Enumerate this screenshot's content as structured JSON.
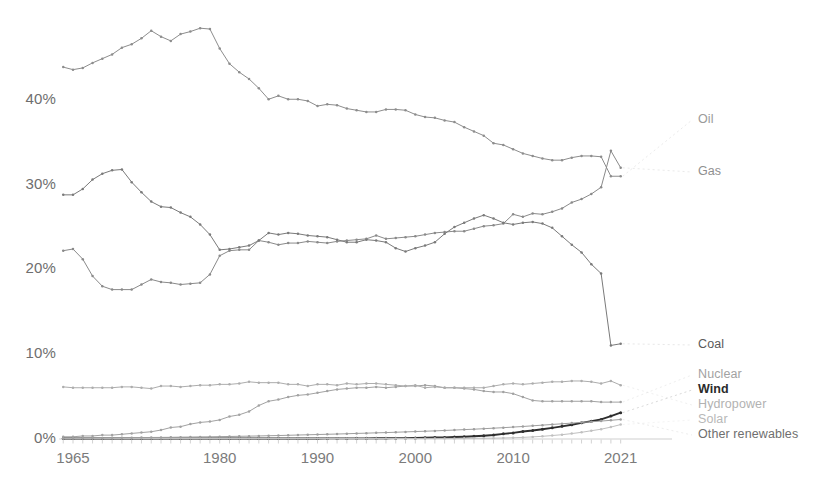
{
  "chart_data": {
    "type": "line",
    "title": "",
    "subtitle": "",
    "xlabel": "",
    "ylabel": "",
    "grid": false,
    "legend_position": "right-inline",
    "xlim": [
      1964,
      2022
    ],
    "ylim": [
      0,
      45
    ],
    "ytick_labels": [
      "40%",
      "30%",
      "20%",
      "10%",
      "0%"
    ],
    "ytick_values": [
      40,
      30,
      20,
      10,
      0
    ],
    "xtick_labels": [
      "1965",
      "1980",
      "1990",
      "2000",
      "2010",
      "2021"
    ],
    "xtick_values": [
      1965,
      1980,
      1990,
      2000,
      2010,
      2021
    ],
    "x": [
      1964,
      1965,
      1966,
      1967,
      1968,
      1969,
      1970,
      1971,
      1972,
      1973,
      1974,
      1975,
      1976,
      1977,
      1978,
      1979,
      1980,
      1981,
      1982,
      1983,
      1984,
      1985,
      1986,
      1987,
      1988,
      1989,
      1990,
      1991,
      1992,
      1993,
      1994,
      1995,
      1996,
      1997,
      1998,
      1999,
      2000,
      2001,
      2002,
      2003,
      2004,
      2005,
      2006,
      2007,
      2008,
      2009,
      2010,
      2011,
      2012,
      2013,
      2014,
      2015,
      2016,
      2017,
      2018,
      2019,
      2020,
      2021
    ],
    "series": [
      {
        "name": "Oil",
        "color": "#8d8d8d",
        "label_color": "#9a9a9a",
        "bold": false,
        "values": [
          43.9,
          43.6,
          43.8,
          44.4,
          44.9,
          45.4,
          46.2,
          46.6,
          47.3,
          48.2,
          47.5,
          47.0,
          47.8,
          48.1,
          48.5,
          48.4,
          46.1,
          44.3,
          43.3,
          42.5,
          41.4,
          40.1,
          40.5,
          40.1,
          40.1,
          39.9,
          39.3,
          39.5,
          39.4,
          39.0,
          38.8,
          38.6,
          38.6,
          38.9,
          38.9,
          38.8,
          38.3,
          38.0,
          37.9,
          37.6,
          37.4,
          36.8,
          36.3,
          35.8,
          34.9,
          34.7,
          34.2,
          33.7,
          33.4,
          33.1,
          32.9,
          32.9,
          33.2,
          33.4,
          33.4,
          33.3,
          31.0,
          31.0
        ]
      },
      {
        "name": "Gas",
        "color": "#8a8a8a",
        "label_color": "#8f8f8f",
        "bold": false,
        "values": [
          22.2,
          22.4,
          21.2,
          19.2,
          18.0,
          17.6,
          17.6,
          17.6,
          18.2,
          18.8,
          18.5,
          18.4,
          18.2,
          18.3,
          18.4,
          19.4,
          21.6,
          22.2,
          22.3,
          22.3,
          23.4,
          23.2,
          22.9,
          23.1,
          23.1,
          23.3,
          23.2,
          23.1,
          23.3,
          23.4,
          23.5,
          23.6,
          24.0,
          23.6,
          23.7,
          23.8,
          23.9,
          24.1,
          24.3,
          24.4,
          24.5,
          24.5,
          24.8,
          25.1,
          25.2,
          25.4,
          26.5,
          26.2,
          26.6,
          26.5,
          26.8,
          27.2,
          27.9,
          28.3,
          28.9,
          29.7,
          34.0,
          32.0
        ]
      },
      {
        "name": "Coal",
        "color": "#7a7a7a",
        "label_color": "#5a5a5a",
        "bold": false,
        "values": [
          28.8,
          28.8,
          29.5,
          30.6,
          31.3,
          31.7,
          31.8,
          30.3,
          29.1,
          28.0,
          27.4,
          27.3,
          26.7,
          26.2,
          25.3,
          24.1,
          22.3,
          22.4,
          22.6,
          22.8,
          23.4,
          24.3,
          24.1,
          24.3,
          24.2,
          24.0,
          23.9,
          23.8,
          23.5,
          23.2,
          23.2,
          23.5,
          23.4,
          23.2,
          22.5,
          22.1,
          22.5,
          22.8,
          23.2,
          24.2,
          25.0,
          25.5,
          26.0,
          26.4,
          26.0,
          25.5,
          25.3,
          25.5,
          25.6,
          25.4,
          24.9,
          23.9,
          22.9,
          22.0,
          20.6,
          19.5,
          11.0,
          11.2
        ]
      },
      {
        "name": "Nuclear",
        "color": "#a2a2a2",
        "label_color": "#a2a2a2",
        "bold": false,
        "values": [
          0.2,
          0.2,
          0.3,
          0.3,
          0.4,
          0.4,
          0.5,
          0.6,
          0.7,
          0.8,
          1.0,
          1.3,
          1.4,
          1.7,
          1.9,
          2.0,
          2.2,
          2.6,
          2.8,
          3.2,
          3.9,
          4.4,
          4.6,
          4.9,
          5.1,
          5.2,
          5.4,
          5.6,
          5.8,
          5.9,
          6.0,
          6.0,
          6.1,
          6.0,
          6.1,
          6.2,
          6.2,
          6.3,
          6.2,
          6.0,
          6.0,
          5.9,
          5.8,
          5.6,
          5.5,
          5.5,
          5.3,
          4.9,
          4.5,
          4.4,
          4.4,
          4.4,
          4.4,
          4.4,
          4.4,
          4.3,
          4.3,
          4.3
        ]
      },
      {
        "name": "Hydropower",
        "color": "#adadad",
        "label_color": "#b2b2b2",
        "bold": false,
        "values": [
          6.1,
          6.0,
          6.0,
          6.0,
          6.0,
          6.0,
          6.1,
          6.1,
          6.0,
          5.9,
          6.2,
          6.2,
          6.1,
          6.2,
          6.3,
          6.3,
          6.4,
          6.4,
          6.5,
          6.7,
          6.6,
          6.6,
          6.6,
          6.4,
          6.4,
          6.2,
          6.4,
          6.4,
          6.3,
          6.5,
          6.4,
          6.5,
          6.5,
          6.4,
          6.3,
          6.2,
          6.3,
          6.0,
          6.1,
          6.0,
          6.0,
          6.0,
          6.0,
          6.0,
          6.2,
          6.4,
          6.5,
          6.4,
          6.5,
          6.6,
          6.7,
          6.7,
          6.8,
          6.8,
          6.7,
          6.5,
          6.8,
          6.3
        ]
      },
      {
        "name": "Wind",
        "color": "#2e2e2e",
        "label_color": "#2b2b2b",
        "bold": true,
        "values": [
          0.0,
          0.0,
          0.0,
          0.0,
          0.0,
          0.0,
          0.0,
          0.0,
          0.0,
          0.0,
          0.0,
          0.0,
          0.0,
          0.0,
          0.0,
          0.0,
          0.0,
          0.0,
          0.0,
          0.0,
          0.0,
          0.0,
          0.0,
          0.0,
          0.0,
          0.0,
          0.0,
          0.01,
          0.01,
          0.01,
          0.02,
          0.02,
          0.03,
          0.03,
          0.04,
          0.05,
          0.07,
          0.09,
          0.11,
          0.13,
          0.17,
          0.21,
          0.26,
          0.33,
          0.42,
          0.55,
          0.66,
          0.83,
          0.95,
          1.1,
          1.26,
          1.44,
          1.62,
          1.85,
          2.05,
          2.25,
          2.65,
          3.05
        ]
      },
      {
        "name": "Solar",
        "color": "#c0c0c0",
        "label_color": "#b8b8b8",
        "bold": false,
        "values": [
          0.0,
          0.0,
          0.0,
          0.0,
          0.0,
          0.0,
          0.0,
          0.0,
          0.0,
          0.0,
          0.0,
          0.0,
          0.0,
          0.0,
          0.0,
          0.0,
          0.0,
          0.0,
          0.0,
          0.0,
          0.0,
          0.0,
          0.0,
          0.0,
          0.0,
          0.0,
          0.0,
          0.0,
          0.0,
          0.0,
          0.0,
          0.0,
          0.0,
          0.0,
          0.0,
          0.0,
          0.0,
          0.01,
          0.01,
          0.01,
          0.01,
          0.02,
          0.02,
          0.03,
          0.04,
          0.06,
          0.09,
          0.13,
          0.19,
          0.26,
          0.35,
          0.45,
          0.58,
          0.73,
          0.92,
          1.1,
          1.35,
          1.65
        ]
      },
      {
        "name": "Other renewables",
        "color": "#9e9e9e",
        "label_color": "#6f6f6f",
        "bold": false,
        "values": [
          0.05,
          0.06,
          0.06,
          0.07,
          0.07,
          0.08,
          0.09,
          0.1,
          0.11,
          0.12,
          0.13,
          0.14,
          0.16,
          0.17,
          0.19,
          0.2,
          0.22,
          0.24,
          0.26,
          0.28,
          0.3,
          0.33,
          0.35,
          0.38,
          0.41,
          0.44,
          0.47,
          0.5,
          0.53,
          0.56,
          0.6,
          0.63,
          0.67,
          0.7,
          0.74,
          0.78,
          0.82,
          0.86,
          0.9,
          0.95,
          1.0,
          1.05,
          1.1,
          1.16,
          1.22,
          1.28,
          1.35,
          1.42,
          1.5,
          1.58,
          1.66,
          1.74,
          1.82,
          1.9,
          1.98,
          2.06,
          2.15,
          2.25
        ]
      }
    ],
    "series_label_positions": [
      {
        "name": "Oil",
        "x": 698,
        "y": 112
      },
      {
        "name": "Gas",
        "x": 698,
        "y": 164
      },
      {
        "name": "Coal",
        "x": 698,
        "y": 337
      },
      {
        "name": "Nuclear",
        "x": 698,
        "y": 367
      },
      {
        "name": "Wind",
        "x": 698,
        "y": 382
      },
      {
        "name": "Hydropower",
        "x": 698,
        "y": 397
      },
      {
        "name": "Solar",
        "x": 698,
        "y": 412
      },
      {
        "name": "Other renewables",
        "x": 698,
        "y": 427
      }
    ]
  }
}
